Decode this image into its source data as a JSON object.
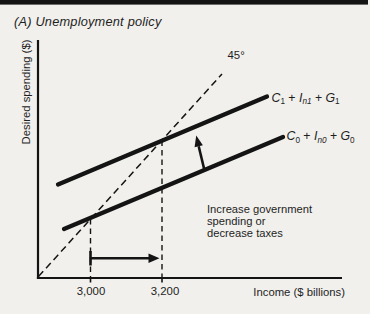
{
  "figure": {
    "panel_title": "(A) Unemployment policy",
    "y_axis_label": "Desired spending ($)",
    "x_axis_label": "Income ($ billions)",
    "angle_label": "45°",
    "x_ticks": [
      "3,000",
      "3,200"
    ],
    "curve_upper": {
      "c": "C",
      "c_sub": "1",
      "plus1": " + ",
      "i": "I",
      "i_sub": "n1",
      "plus2": " + ",
      "g": "G",
      "g_sub": "1"
    },
    "curve_lower": {
      "c": "C",
      "c_sub": "0",
      "plus1": " + ",
      "i": "I",
      "i_sub": "n0",
      "plus2": " + ",
      "g": "G",
      "g_sub": "0"
    },
    "annotation_lines": [
      "Increase government",
      "spending or",
      "decrease taxes"
    ],
    "colors": {
      "ink": "#1e1e1e",
      "line": "#141414",
      "background": "#f1f0ec",
      "top_bar": "#141414"
    }
  }
}
